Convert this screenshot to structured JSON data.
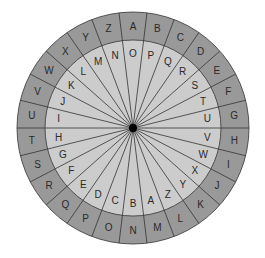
{
  "diagram": {
    "type": "cipher-wheel",
    "center": [
      133,
      128
    ],
    "outer_radius": 116,
    "inner_radius": 88,
    "hub_radius": 4,
    "colors": {
      "outer_ring": "#999999",
      "inner_disk": "#cccccc",
      "lines": "#333333",
      "hub": "#000000",
      "text": "#2a2a2a"
    },
    "outer_ring_letters": [
      "A",
      "B",
      "C",
      "D",
      "E",
      "F",
      "G",
      "H",
      "I",
      "J",
      "K",
      "L",
      "M",
      "N",
      "O",
      "P",
      "Q",
      "R",
      "S",
      "T",
      "U",
      "V",
      "W",
      "X",
      "Y",
      "Z"
    ],
    "inner_ring_letters": [
      "O",
      "P",
      "Q",
      "R",
      "S",
      "T",
      "U",
      "V",
      "W",
      "X",
      "Y",
      "Z",
      "A",
      "B",
      "C",
      "D",
      "E",
      "F",
      "G",
      "H",
      "I",
      "J",
      "K",
      "L",
      "M",
      "N"
    ],
    "start_angle_deg": 0,
    "direction": "clockwise"
  }
}
